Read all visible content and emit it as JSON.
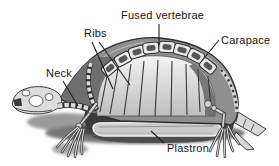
{
  "figure": {
    "labels": {
      "fused_vertebrae": "Fused vertebrae",
      "ribs": "Ribs",
      "carapace": "Carapace",
      "neck": "Neck",
      "plastron": "Plastron"
    },
    "colors": {
      "background": "#ffffff",
      "outline": "#2d2d2d",
      "shell_rim": "#8f8f8f",
      "shell_left_shade": "#6f6f6f",
      "interior_top": "#f4f4f4",
      "interior_bottom": "#bdbdbd",
      "interior_right_shade": "#5f5f5f",
      "underside_dark": "#3b3b3b",
      "plastron_fill": "#cbcbcb",
      "bone": "#dcdcdc",
      "shadow_mid": "#787878",
      "shadow_dark": "#474747",
      "label_text": "#161616"
    }
  }
}
